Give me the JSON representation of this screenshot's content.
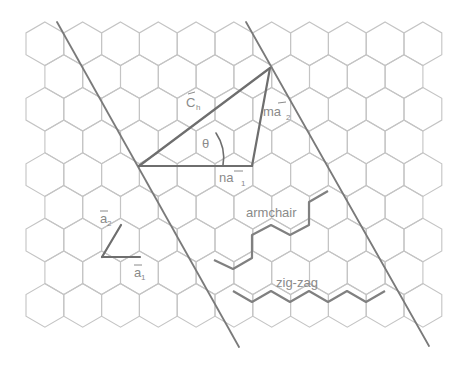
{
  "diagram": {
    "colors": {
      "background": "#ffffff",
      "hex_stroke": "#c4c4c4",
      "line": "#7a7a7a",
      "vector": "#6e6e6e",
      "label": "#8a8a8a"
    },
    "lattice": {
      "type": "hexagonal-pointy-top",
      "origin_x": 26,
      "origin_y": 22,
      "hex_width": 37.8,
      "side": 21.8,
      "rows": 9,
      "even_row_count": 11,
      "odd_row_count": 10
    },
    "labels": {
      "chiral_vector": "C",
      "chiral_sub": "h",
      "theta": "θ",
      "ma2": "ma",
      "ma2_sub": "2",
      "na1": "na",
      "na1_sub": "1",
      "a1": "a",
      "a1_sub": "1",
      "a2": "a",
      "a2_sub": "2",
      "armchair": "armchair",
      "zigzag": "zig-zag"
    },
    "points": {
      "origin": [
        139,
        166
      ],
      "ch_tip": [
        270,
        68
      ],
      "na1_end": [
        252,
        166
      ],
      "a_origin": [
        102,
        257
      ],
      "a1_tip": [
        140,
        257
      ],
      "a2_tip": [
        121,
        225
      ]
    },
    "cut_lines": [
      {
        "x1": 57,
        "y1": 22,
        "x2": 239,
        "y2": 347
      },
      {
        "x1": 246,
        "y1": 22,
        "x2": 429,
        "y2": 346
      }
    ],
    "armchair_path": [
      [
        214,
        260
      ],
      [
        233,
        269
      ],
      [
        252,
        258
      ],
      [
        252,
        235
      ],
      [
        271,
        225
      ],
      [
        290,
        235
      ],
      [
        309,
        225
      ],
      [
        309,
        202
      ],
      [
        328,
        191
      ]
    ],
    "zigzag_path": [
      [
        233,
        291
      ],
      [
        252,
        302
      ],
      [
        271,
        291
      ],
      [
        290,
        302
      ],
      [
        309,
        291
      ],
      [
        328,
        302
      ],
      [
        347,
        291
      ],
      [
        366,
        302
      ],
      [
        385,
        291
      ]
    ]
  }
}
